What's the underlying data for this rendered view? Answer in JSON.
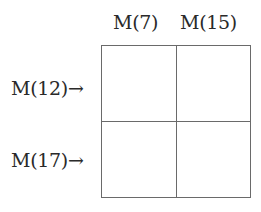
{
  "diagram": {
    "type": "2x2 grid",
    "columns": [
      {
        "label": "M(7)"
      },
      {
        "label": "M(15)"
      }
    ],
    "rows": [
      {
        "label": "M(12)→"
      },
      {
        "label": "M(17)→"
      }
    ],
    "cells": [
      [
        "",
        ""
      ],
      [
        "",
        ""
      ]
    ],
    "colors": {
      "text": "#2a2a2a",
      "grid_line": "#6a6a6a",
      "background": "#ffffff"
    }
  }
}
